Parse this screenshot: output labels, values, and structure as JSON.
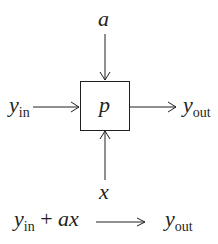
{
  "diagram": {
    "block": {
      "label": "p"
    },
    "inputs": {
      "top": {
        "label": "a"
      },
      "left": {
        "base": "y",
        "sub": "in"
      },
      "bottom": {
        "label": "x"
      }
    },
    "output": {
      "base": "y",
      "sub": "out"
    },
    "equation": {
      "lhs_base": "y",
      "lhs_sub": "in",
      "plus": "+",
      "term": "ax",
      "rhs_base": "y",
      "rhs_sub": "out"
    },
    "colors": {
      "stroke": "#231f20",
      "background": "#ffffff"
    }
  }
}
